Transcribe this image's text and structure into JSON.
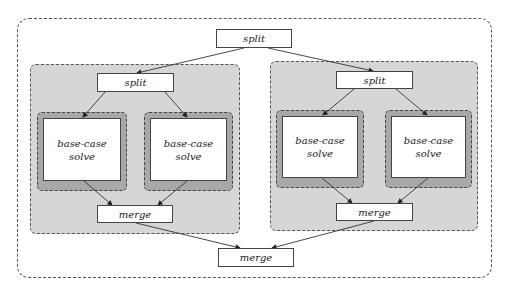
{
  "diagram": {
    "top_split": {
      "label": "split"
    },
    "bottom_merge": {
      "label": "merge"
    },
    "groups": [
      {
        "split": {
          "label": "split"
        },
        "leaves": [
          {
            "line1": "base-case",
            "line2": "solve"
          },
          {
            "line1": "base-case",
            "line2": "solve"
          }
        ],
        "merge": {
          "label": "merge"
        }
      },
      {
        "split": {
          "label": "split"
        },
        "leaves": [
          {
            "line1": "base-case",
            "line2": "solve"
          },
          {
            "line1": "base-case",
            "line2": "solve"
          }
        ],
        "merge": {
          "label": "merge"
        }
      }
    ],
    "colors": {
      "group_fill": "#d6d6d6",
      "leaf_wrap_fill": "#a8a8a8",
      "node_fill": "#ffffff",
      "stroke": "#444444"
    }
  }
}
